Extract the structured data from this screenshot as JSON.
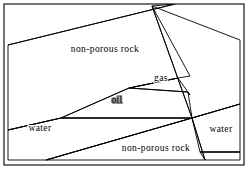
{
  "figure": {
    "background_color": "#ffffff",
    "frame": {
      "color": "#000000",
      "x": 4,
      "y": 4,
      "width": 240,
      "height": 161
    }
  },
  "palette": {
    "non_porous_rock_fill": "#ffffff",
    "non_porous_rock_hatch": "#6e6e6e",
    "oil_fill": "#808080",
    "water_fill": "#e8e8e8",
    "gas_fill": "#ffffff",
    "outline": "#000000"
  },
  "layers": [
    {
      "id": "non-porous-rock-upper",
      "label": "non-porous rock",
      "fill": "#ffffff",
      "pattern": "vertical-hatch",
      "label_x": 105,
      "label_y": 52,
      "points": "8,45 175,4 190,4 152,6 190,76 178,78 8,130"
    },
    {
      "id": "gas-pocket",
      "label": "gas",
      "fill": "#ffffff",
      "pattern": "none",
      "label_x": 160,
      "label_y": 80,
      "points": "129,88 178,78 188,92"
    },
    {
      "id": "oil-reservoir",
      "label": "oil",
      "fill": "#808080",
      "pattern": "none",
      "label_x": 116,
      "label_y": 102,
      "points": "129,88 188,92 192,118 61,118"
    },
    {
      "id": "water-left",
      "label": "water",
      "fill": "#e8e8e8",
      "pattern": "none",
      "label_x": 38,
      "label_y": 130,
      "points": "8,130 61,118 192,118 8,160"
    },
    {
      "id": "non-porous-rock-lower",
      "label": "non-porous rock",
      "fill": "#ffffff",
      "pattern": "vertical-hatch",
      "label_x": 155,
      "label_y": 150,
      "points": "192,118 205,160 46,160"
    },
    {
      "id": "water-right",
      "label": "water",
      "fill": "#e8e8e8",
      "pattern": "none",
      "label_x": 221,
      "label_y": 130,
      "points": "192,118 240,104 240,152 200,152"
    },
    {
      "id": "non-porous-rock-right-upper",
      "label": "",
      "fill": "#ffffff",
      "pattern": "vertical-hatch",
      "label_x": 0,
      "label_y": 0,
      "points": "152,6 240,40 240,104 192,118"
    },
    {
      "id": "non-porous-rock-right-lower",
      "label": "",
      "fill": "#ffffff",
      "pattern": "vertical-hatch",
      "label_x": 0,
      "label_y": 0,
      "points": "200,152 240,152 240,160 205,160"
    }
  ],
  "labels": [
    {
      "id": "label-non-porous-rock-upper",
      "text": "non-porous rock",
      "x": 105,
      "y": 52,
      "anchor": "middle",
      "on_oil": false
    },
    {
      "id": "label-gas",
      "text": "gas",
      "x": 161,
      "y": 81,
      "anchor": "middle",
      "on_oil": false
    },
    {
      "id": "label-oil",
      "text": "oil",
      "x": 117,
      "y": 103,
      "anchor": "middle",
      "on_oil": true
    },
    {
      "id": "label-water-left",
      "text": "water",
      "x": 40,
      "y": 131,
      "anchor": "middle",
      "on_oil": false
    },
    {
      "id": "label-water-right",
      "text": "water",
      "x": 221,
      "y": 132,
      "anchor": "middle",
      "on_oil": false
    },
    {
      "id": "label-non-porous-rock-lower",
      "text": "non-porous rock",
      "x": 156,
      "y": 151,
      "anchor": "middle",
      "on_oil": false
    }
  ],
  "fault": {
    "id": "fault-line",
    "description": "fault",
    "segments": [
      "M152,6 L192,118",
      "M192,118 L205,160",
      "M192,118 L240,104",
      "M200,152 L240,152"
    ]
  },
  "bedding": {
    "segments": [
      "M8,45 L175,4",
      "M8,130 L192,118",
      "M129,88 L178,78",
      "M178,78 L188,92",
      "M129,88 L61,118",
      "M8,160 L46,160",
      "M46,160 L192,118"
    ]
  }
}
